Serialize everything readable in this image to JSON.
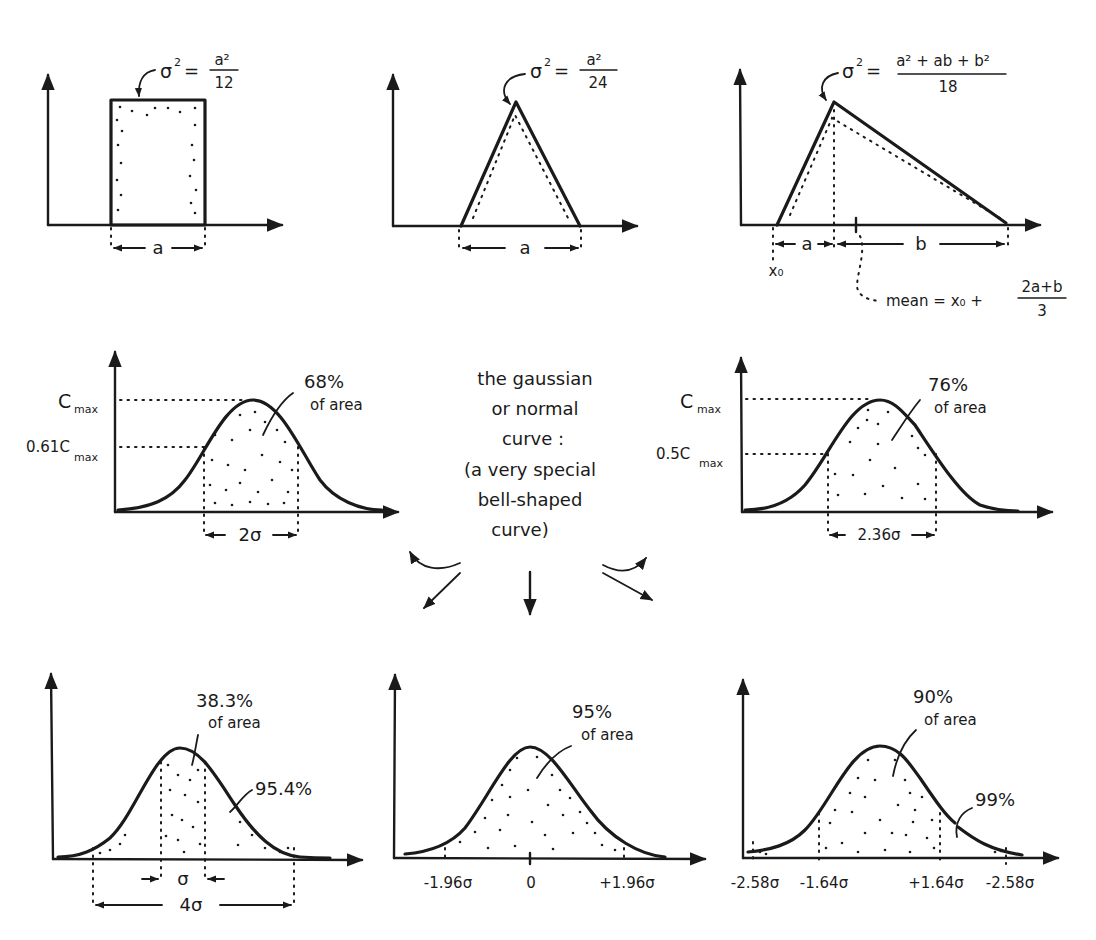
{
  "panels": {
    "uniform": {
      "variance_label": "σ² = a²/12",
      "variance_lhs": "σ",
      "variance_exp": "2",
      "variance_num": "a²",
      "variance_den": "12",
      "width_label": "a"
    },
    "symmetric_triangle": {
      "variance_lhs": "σ",
      "variance_exp": "2",
      "variance_num": "a²",
      "variance_den": "24",
      "width_label": "a"
    },
    "asymmetric_triangle": {
      "variance_lhs": "σ",
      "variance_exp": "2",
      "variance_num": "a² + ab + b²",
      "variance_den": "18",
      "left_width_label": "a",
      "right_width_label": "b",
      "origin_label": "x₀",
      "mean_prefix": "mean = x₀ +",
      "mean_num": "2a+b",
      "mean_den": "3"
    },
    "gaussian_68": {
      "ymax_label": "C",
      "ymax_sub": "max",
      "ylevel_label": "0.61C",
      "ylevel_sub": "max",
      "area_pct": "68%",
      "area_text": "of area",
      "width_label": "2σ"
    },
    "center_note": {
      "lines": [
        "the gaussian",
        "or normal",
        "curve :",
        "(a very special",
        "bell-shaped",
        "curve)"
      ]
    },
    "gaussian_76": {
      "ymax_label": "C",
      "ymax_sub": "max",
      "ylevel_label": "0.5C",
      "ylevel_sub": "max",
      "area_pct": "76%",
      "area_text": "of area",
      "width_label": "2.36σ"
    },
    "gaussian_38": {
      "area_pct": "38.3%",
      "area_text": "of area",
      "outer_pct": "95.4%",
      "inner_width_label": "σ",
      "outer_width_label": "4σ"
    },
    "gaussian_95": {
      "area_pct": "95%",
      "area_text": "of area",
      "ticks": [
        "-1.96σ",
        "0",
        "+1.96σ"
      ]
    },
    "gaussian_90": {
      "area_pct": "90%",
      "area_text": "of area",
      "outer_pct": "99%",
      "ticks": [
        "-2.58σ",
        "-1.64σ",
        "+1.64σ",
        "-2.58σ"
      ]
    }
  },
  "colors": {
    "ink": "#1a1a1a",
    "paper": "#ffffff"
  }
}
